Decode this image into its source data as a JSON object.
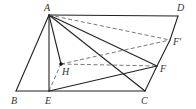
{
  "diagram": {
    "type": "geometry",
    "points": {
      "A": {
        "x": 49,
        "y": 15,
        "label": "A",
        "lx": 44,
        "ly": 11
      },
      "D": {
        "x": 178,
        "y": 16,
        "label": "D",
        "lx": 177,
        "ly": 11
      },
      "F_prime": {
        "x": 170,
        "y": 40,
        "label": "F′",
        "lx": 173,
        "ly": 45
      },
      "F": {
        "x": 157,
        "y": 66,
        "label": "F",
        "lx": 160,
        "ly": 72
      },
      "C": {
        "x": 145,
        "y": 91,
        "label": "C",
        "lx": 141,
        "ly": 104
      },
      "E": {
        "x": 49,
        "y": 91,
        "label": "E",
        "lx": 45,
        "ly": 104
      },
      "B": {
        "x": 16,
        "y": 91,
        "label": "B",
        "lx": 11,
        "ly": 104
      },
      "H": {
        "x": 61,
        "y": 64,
        "label": "H",
        "lx": 62,
        "ly": 75
      }
    },
    "solid_segments": [
      [
        "A",
        "D"
      ],
      [
        "D",
        "F_prime"
      ],
      [
        "F_prime",
        "F"
      ],
      [
        "F",
        "C"
      ],
      [
        "C",
        "E"
      ],
      [
        "E",
        "B"
      ],
      [
        "B",
        "A"
      ],
      [
        "A",
        "E"
      ],
      [
        "A",
        "H"
      ],
      [
        "A",
        "C"
      ],
      [
        "A",
        "F"
      ],
      [
        "E",
        "F"
      ]
    ],
    "dashed_segments": [
      [
        "A",
        "F_prime"
      ],
      [
        "H",
        "F_prime"
      ],
      [
        "H",
        "F"
      ],
      [
        "E",
        "H"
      ]
    ],
    "labels": [
      "A",
      "B",
      "C",
      "D",
      "E",
      "F",
      "F′",
      "H"
    ]
  }
}
